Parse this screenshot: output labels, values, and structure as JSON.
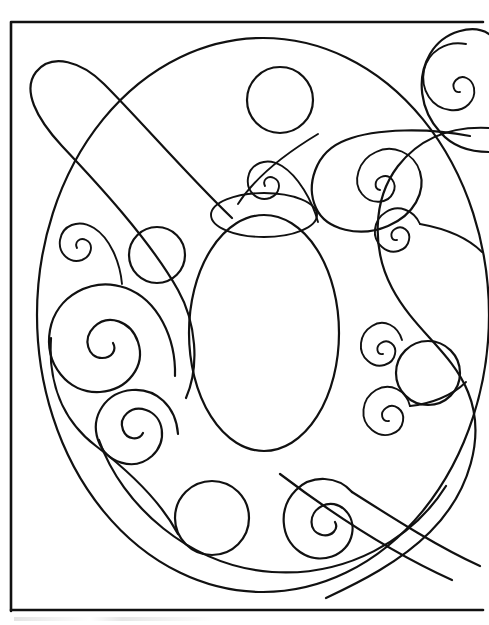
{
  "document": {
    "title": "Butterfly Coloring Page",
    "media_type": "line-art coloring page",
    "background_color": "#ffffff",
    "ink_color": "#111111",
    "canvas": {
      "width": 489,
      "height": 625
    }
  },
  "frame": {
    "name": "page-border",
    "x": 11,
    "y": 22,
    "width": 472,
    "height": 589,
    "stroke_width": 2.6,
    "note": "rectangular border, right and bottom edges run to the image crop"
  },
  "artwork": {
    "subject": "stylized butterfly body with decorative spirals and circles",
    "shapes": [
      {
        "id": "body-outer-oval",
        "name": "large-outer-oval",
        "kind": "ellipse",
        "cx": 263,
        "cy": 315,
        "rx": 226,
        "ry": 277
      },
      {
        "id": "body-inner-oval",
        "name": "center-body-oval",
        "kind": "ellipse",
        "cx": 264,
        "cy": 333,
        "rx": 75,
        "ry": 118
      },
      {
        "id": "head-lens",
        "name": "head-lens-shape",
        "kind": "ellipse",
        "cx": 264,
        "cy": 215,
        "rx": 53,
        "ry": 22
      },
      {
        "id": "antenna-left",
        "name": "left-antenna-loop",
        "kind": "teardrop",
        "note": "long teardrop sweeping from upper-left down across the body"
      },
      {
        "id": "antenna-right",
        "name": "right-antenna-sweep",
        "kind": "ribbon",
        "note": "long S ribbon from top-right spiral down to lower-right corner"
      }
    ],
    "circles": [
      {
        "id": "circle-top",
        "name": "top-circle",
        "cx": 280,
        "cy": 100,
        "r": 33
      },
      {
        "id": "circle-left-mid",
        "name": "left-middle-circle",
        "cx": 157,
        "cy": 255,
        "r": 28
      },
      {
        "id": "circle-right-mid",
        "name": "right-middle-circle",
        "cx": 428,
        "cy": 373,
        "r": 32
      },
      {
        "id": "circle-bottom",
        "name": "bottom-circle",
        "cx": 212,
        "cy": 518,
        "r": 37
      }
    ],
    "spirals": [
      {
        "id": "spiral-top-right-corner",
        "name": "top-right-corner-spiral",
        "cx": 448,
        "cy": 68,
        "turns": 2.4,
        "max_r": 42,
        "direction": "ccw"
      },
      {
        "id": "spiral-upper-right",
        "name": "upper-right-spiral",
        "cx": 378,
        "cy": 176,
        "turns": 2.3,
        "max_r": 34,
        "direction": "ccw"
      },
      {
        "id": "spiral-center-top",
        "name": "center-top-spiral",
        "cx": 268,
        "cy": 178,
        "turns": 1.9,
        "max_r": 22,
        "direction": "ccw"
      },
      {
        "id": "spiral-right-mid",
        "name": "right-mid-spiral",
        "cx": 400,
        "cy": 238,
        "turns": 2.1,
        "max_r": 24,
        "direction": "ccw"
      },
      {
        "id": "spiral-left-upper",
        "name": "left-upper-spiral",
        "cx": 80,
        "cy": 243,
        "turns": 1.9,
        "max_r": 22,
        "direction": "cw"
      },
      {
        "id": "spiral-left-large",
        "name": "left-large-spiral",
        "cx": 104,
        "cy": 340,
        "turns": 2.6,
        "max_r": 52,
        "direction": "cw"
      },
      {
        "id": "spiral-right-lower",
        "name": "right-lower-spiral",
        "cx": 381,
        "cy": 356,
        "turns": 2.0,
        "max_r": 22,
        "direction": "ccw"
      },
      {
        "id": "spiral-right-lower-2",
        "name": "right-lower-spiral-two",
        "cx": 385,
        "cy": 428,
        "turns": 2.1,
        "max_r": 25,
        "direction": "ccw"
      },
      {
        "id": "spiral-bottom-left",
        "name": "bottom-left-spiral",
        "cx": 138,
        "cy": 459,
        "turns": 2.4,
        "max_r": 40,
        "direction": "cw"
      },
      {
        "id": "spiral-bottom-right",
        "name": "bottom-right-spiral",
        "cx": 313,
        "cy": 526,
        "turns": 2.4,
        "max_r": 38,
        "direction": "ccw"
      }
    ]
  },
  "footer": {
    "name": "scan-artifact-strip",
    "visible_text": "",
    "note": "faint scanner smudge below the page border, no legible text"
  }
}
